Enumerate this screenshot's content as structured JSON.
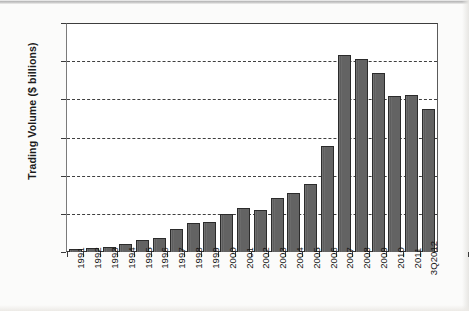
{
  "chart_data": {
    "type": "bar",
    "title": "",
    "xlabel": "",
    "ylabel": "Trading Volume ($ billions)",
    "ylim": [
      0,
      600
    ],
    "ytick_labels": [
      "600",
      "500",
      "400",
      "300",
      "200",
      "100",
      "0"
    ],
    "yticks": [
      600,
      500,
      400,
      300,
      200,
      100,
      0
    ],
    "grid": "horizontal-dashed",
    "gridline_values": [
      500,
      400,
      300,
      200,
      100
    ],
    "legend": "none",
    "bar_color": "#636363",
    "bar_edge_color": "#2b2b2b",
    "plot_background": "#ffffff",
    "categories": [
      "1991",
      "1992",
      "1993",
      "1994",
      "1995",
      "1996",
      "1997",
      "1998",
      "1999",
      "2000",
      "2001",
      "2002",
      "2003",
      "2004",
      "2005",
      "2006",
      "2007",
      "2008",
      "2009",
      "2010",
      "2011",
      "3Q2012"
    ],
    "values": [
      8,
      11,
      14,
      20,
      31,
      38,
      60,
      75,
      78,
      100,
      115,
      110,
      142,
      155,
      177,
      277,
      515,
      505,
      468,
      410,
      412,
      375
    ]
  }
}
